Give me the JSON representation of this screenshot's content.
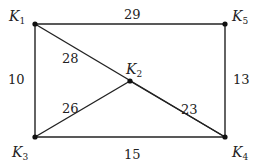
{
  "graph": {
    "nodes": [
      {
        "id": "K1",
        "base": "K",
        "sub": "1",
        "x": 35,
        "y": 24,
        "lx": 9,
        "ly": 21
      },
      {
        "id": "K5",
        "base": "K",
        "sub": "5",
        "x": 225,
        "y": 24,
        "lx": 232,
        "ly": 21
      },
      {
        "id": "K2",
        "base": "K",
        "sub": "2",
        "x": 130,
        "y": 81,
        "lx": 126,
        "ly": 74
      },
      {
        "id": "K3",
        "base": "K",
        "sub": "3",
        "x": 35,
        "y": 137,
        "lx": 12,
        "ly": 157
      },
      {
        "id": "K4",
        "base": "K",
        "sub": "4",
        "x": 225,
        "y": 137,
        "lx": 232,
        "ly": 157
      }
    ],
    "edges": [
      {
        "from": "K1",
        "to": "K5",
        "weight": "29",
        "lx": 124,
        "ly": 19
      },
      {
        "from": "K1",
        "to": "K3",
        "weight": "10",
        "lx": 8,
        "ly": 84
      },
      {
        "from": "K5",
        "to": "K4",
        "weight": "13",
        "lx": 233,
        "ly": 84
      },
      {
        "from": "K3",
        "to": "K4",
        "weight": "15",
        "lx": 124,
        "ly": 159
      },
      {
        "from": "K1",
        "to": "K4",
        "weight": "28",
        "lx": 62,
        "ly": 63
      },
      {
        "from": "K3",
        "to": "K2",
        "weight": "26",
        "lx": 62,
        "ly": 113
      },
      {
        "from": "K2",
        "to": "K4",
        "weight": "23",
        "lx": 181,
        "ly": 114
      }
    ]
  }
}
